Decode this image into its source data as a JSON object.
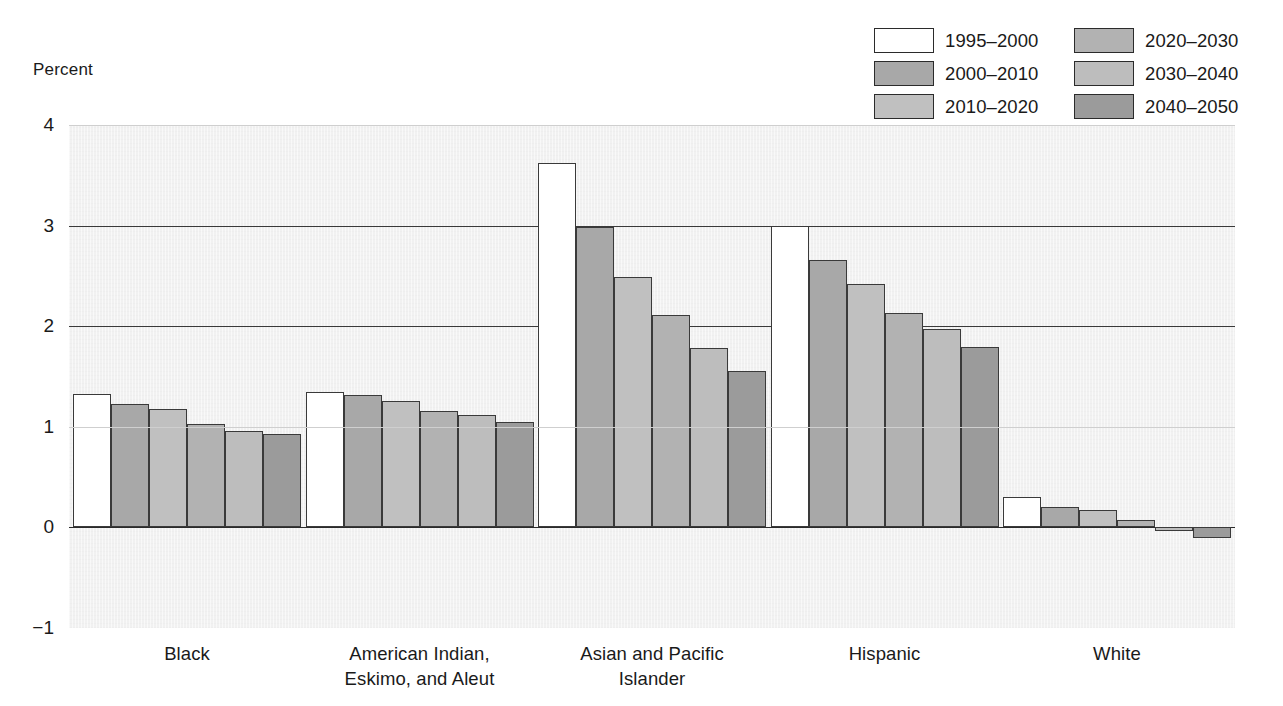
{
  "chart_data": {
    "type": "bar",
    "title": "",
    "xlabel": "",
    "ylabel": "Percent",
    "ylim": [
      -1,
      4
    ],
    "yticks": [
      4,
      3,
      2,
      1,
      0,
      -1
    ],
    "ytick_labels": [
      "4",
      "3",
      "2",
      "1",
      "0",
      "−1"
    ],
    "grid": true,
    "legend_position": "top-right",
    "categories": [
      "Black",
      "American Indian,\nEskimo, and Aleut",
      "Asian and Pacific\nIslander",
      "Hispanic",
      "White"
    ],
    "series": [
      {
        "name": "1995–2000",
        "color": "#ffffff",
        "values": [
          1.33,
          1.35,
          3.62,
          3.0,
          0.3
        ]
      },
      {
        "name": "2000–2010",
        "color": "#a8a8a8",
        "values": [
          1.23,
          1.32,
          2.99,
          2.66,
          0.2
        ]
      },
      {
        "name": "2010–2020",
        "color": "#c0c0c0",
        "values": [
          1.18,
          1.26,
          2.49,
          2.42,
          0.17
        ]
      },
      {
        "name": "2020–2030",
        "color": "#b2b2b2",
        "values": [
          1.03,
          1.16,
          2.11,
          2.13,
          0.07
        ]
      },
      {
        "name": "2030–2040",
        "color": "#bdbdbd",
        "values": [
          0.96,
          1.12,
          1.78,
          1.97,
          -0.04
        ]
      },
      {
        "name": "2040–2050",
        "color": "#9b9b9b",
        "values": [
          0.93,
          1.05,
          1.55,
          1.79,
          -0.11
        ]
      }
    ]
  },
  "axis": {
    "title": "Percent"
  },
  "legend": {
    "items": [
      {
        "label": "1995–2000",
        "color": "#ffffff"
      },
      {
        "label": "2020–2030",
        "color": "#b2b2b2"
      },
      {
        "label": "2000–2010",
        "color": "#a8a8a8"
      },
      {
        "label": "2030–2040",
        "color": "#bdbdbd"
      },
      {
        "label": "2010–2020",
        "color": "#c0c0c0"
      },
      {
        "label": "2040–2050",
        "color": "#9b9b9b"
      }
    ]
  },
  "style": {
    "plot_background": "#f1f1f1",
    "gridline_color": "#3a3a3a",
    "faint_gridline_color": "#cfcfcf",
    "bar_outline_color": "#3a3a3a",
    "text_color": "#1a1a1a"
  }
}
